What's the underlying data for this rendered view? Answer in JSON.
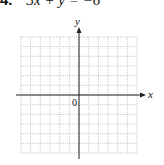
{
  "problem": {
    "number": "4.",
    "equation": "3x + y = −6"
  },
  "graph": {
    "x_axis_label": "x",
    "y_axis_label": "y",
    "origin_label": "0",
    "grid_columns": 12,
    "grid_rows": 12
  }
}
